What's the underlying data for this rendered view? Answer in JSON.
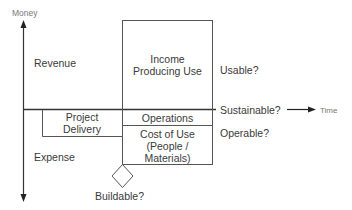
{
  "diagram": {
    "y_axis_label": "Money",
    "x_axis_label": "Time",
    "quadrants": {
      "upper": "Revenue",
      "lower": "Expense"
    },
    "boxes": {
      "income": {
        "line1": "Income",
        "line2": "Producing Use"
      },
      "operations": "Operations",
      "cost_of_use": {
        "line1": "Cost of Use",
        "line2": "(People /",
        "line3": "Materials)"
      },
      "project_delivery": {
        "line1": "Project",
        "line2": "Delivery"
      }
    },
    "questions": {
      "usable": "Usable?",
      "sustainable": "Sustainable?",
      "operable": "Operable?",
      "buildable": "Buildable?"
    },
    "colors": {
      "line": "#333333",
      "box_line": "#555555",
      "text": "#3a3a3a",
      "muted_text": "#777777"
    }
  }
}
